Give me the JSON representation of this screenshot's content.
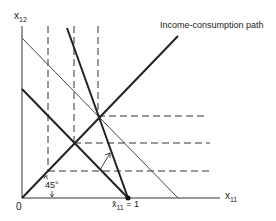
{
  "diagram": {
    "type": "economics-diagram",
    "axes": {
      "y_label": "x",
      "y_label_sub": "12",
      "x_label": "x",
      "x_label_sub": "11",
      "origin_label": "0"
    },
    "annotations": {
      "path_label": "Income-consumption path",
      "angle_label": "45°",
      "endowment_label": "x̄",
      "endowment_sub": "11",
      "endowment_value": " = 1"
    },
    "colors": {
      "ink": "#222222",
      "background": "#ffffff"
    }
  }
}
